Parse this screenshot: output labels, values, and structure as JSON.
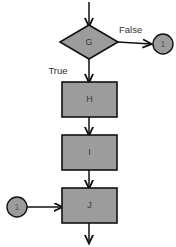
{
  "diagram": {
    "type": "flowchart",
    "title": "",
    "canvas": {
      "width": 176,
      "height": 247,
      "background": "#ffffff"
    },
    "style": {
      "shape_fill": "#9c9c9c",
      "shape_stroke": "#111111",
      "edge_color": "#111111",
      "label_color": "#3a3a3a",
      "edge_label_color": "#303030"
    },
    "nodes": [
      {
        "id": "G",
        "label": "G",
        "shape": "diamond"
      },
      {
        "id": "H",
        "label": "H",
        "shape": "rectangle"
      },
      {
        "id": "I",
        "label": "I",
        "shape": "rectangle"
      },
      {
        "id": "J",
        "label": "J",
        "shape": "rectangle"
      },
      {
        "id": "conn-out",
        "label": "1",
        "shape": "circle"
      },
      {
        "id": "conn-in",
        "label": "1",
        "shape": "circle"
      }
    ],
    "edges": [
      {
        "from": "entry",
        "to": "G",
        "label": ""
      },
      {
        "from": "G",
        "to": "conn-out",
        "label": "False"
      },
      {
        "from": "G",
        "to": "H",
        "label": "True"
      },
      {
        "from": "H",
        "to": "I",
        "label": ""
      },
      {
        "from": "I",
        "to": "J",
        "label": ""
      },
      {
        "from": "conn-in",
        "to": "J",
        "label": ""
      },
      {
        "from": "J",
        "to": "exit",
        "label": ""
      }
    ],
    "labels": {
      "decision": "G",
      "process_h": "H",
      "process_i": "I",
      "process_j": "J",
      "connector_out": "1",
      "connector_in": "1",
      "branch_false": "False",
      "branch_true": "True"
    }
  }
}
